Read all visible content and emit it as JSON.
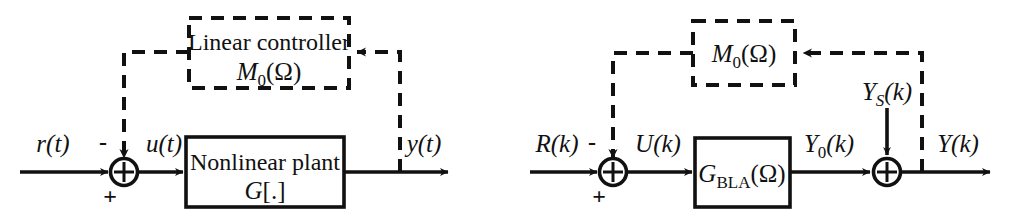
{
  "figure": {
    "type": "block-diagram-pair",
    "colors": {
      "line": "#111111",
      "background": "#ffffff",
      "text": "#111111"
    }
  },
  "left_diagram": {
    "name": "nonlinear-closed-loop",
    "input_label": "r(t)",
    "sum_minus_sign": "-",
    "sum_plus_sign": "+",
    "sum_symbol": "+",
    "mid_label": "u(t)",
    "plant_line1": "Nonlinear plant",
    "plant_line2": "G[.]",
    "plant_line2_italic": "G",
    "plant_line2_rest": "[.]",
    "controller_line1": "Linear controller",
    "controller_line2_main": "M",
    "controller_line2_sub": "0",
    "controller_line2_arg": "(Ω)",
    "output_label": "y(t)"
  },
  "right_diagram": {
    "name": "bla-equivalent-closed-loop",
    "input_label": "R(k)",
    "sum1_minus_sign": "-",
    "sum1_plus_sign": "+",
    "sum_symbol": "+",
    "mid_label": "U(k)",
    "block_main": "G",
    "block_sub": "BLA",
    "block_arg": "(Ω)",
    "after_block_main": "Y",
    "after_block_sub": "0",
    "after_block_rest": "(k)",
    "noise_main": "Y",
    "noise_sub": "S",
    "noise_rest": "(k)",
    "controller_main": "M",
    "controller_sub": "0",
    "controller_arg": "(Ω)",
    "output_label": "Y(k)"
  }
}
